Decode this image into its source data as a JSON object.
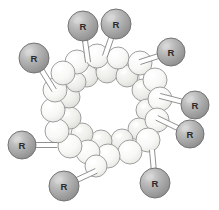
{
  "figure": {
    "width": 219,
    "height": 210,
    "background_color": "#ffffff"
  },
  "style": {
    "ring_sphere_fill": "#f7f7f5",
    "ring_sphere_fill_shaded": "#ededea",
    "ring_sphere_stroke": "#9a9a9a",
    "ring_sphere_stroke_faint": "#bdbdbd",
    "ring_sphere_highlight": "#ffffff",
    "r_sphere_fill": "#b0b0b0",
    "r_sphere_fill_dark": "#8f8f8f",
    "r_sphere_stroke": "#6f6f6f",
    "r_sphere_highlight": "#d8d8d8",
    "bond_fill": "#ffffff",
    "bond_stroke": "#7d7d7d",
    "label_color": "#2b2b2b"
  },
  "cavity": {
    "label": "macrocycle-cavity",
    "center_x": 108,
    "center_y": 104,
    "radius_x": 34,
    "radius_y": 32
  },
  "r_groups": [
    {
      "id": "r-top-left",
      "label": "R",
      "cx": 83,
      "cy": 26,
      "radius": 15,
      "anchor_x": 88,
      "anchor_y": 62
    },
    {
      "id": "r-top-right",
      "label": "R",
      "cx": 116,
      "cy": 24,
      "radius": 15,
      "anchor_x": 105,
      "anchor_y": 56
    },
    {
      "id": "r-upper-right",
      "label": "R",
      "cx": 171,
      "cy": 52,
      "radius": 14,
      "anchor_x": 140,
      "anchor_y": 62
    },
    {
      "id": "r-upper-left",
      "label": "R",
      "cx": 34,
      "cy": 58,
      "radius": 15,
      "anchor_x": 54,
      "anchor_y": 90
    },
    {
      "id": "r-right-upper",
      "label": "R",
      "cx": 195,
      "cy": 105,
      "radius": 14,
      "anchor_x": 160,
      "anchor_y": 96
    },
    {
      "id": "r-right-lower",
      "label": "R",
      "cx": 190,
      "cy": 134,
      "radius": 14,
      "anchor_x": 157,
      "anchor_y": 118
    },
    {
      "id": "r-left-lower",
      "label": "R",
      "cx": 22,
      "cy": 145,
      "radius": 14,
      "anchor_x": 57,
      "anchor_y": 145
    },
    {
      "id": "r-bottom-left",
      "label": "R",
      "cx": 64,
      "cy": 186,
      "radius": 15,
      "anchor_x": 96,
      "anchor_y": 171
    },
    {
      "id": "r-bottom-right",
      "label": "R",
      "cx": 155,
      "cy": 183,
      "radius": 15,
      "anchor_x": 152,
      "anchor_y": 150
    }
  ],
  "ring_spheres": [
    {
      "id": "ring-01",
      "cx": 77,
      "cy": 62,
      "r": 12,
      "shade": "light"
    },
    {
      "id": "ring-02",
      "cx": 97,
      "cy": 56,
      "r": 12,
      "shade": "light"
    },
    {
      "id": "ring-03",
      "cx": 118,
      "cy": 58,
      "r": 11,
      "shade": "light"
    },
    {
      "id": "ring-04",
      "cx": 140,
      "cy": 63,
      "r": 12,
      "shade": "light"
    },
    {
      "id": "ring-05",
      "cx": 155,
      "cy": 80,
      "r": 12,
      "shade": "light"
    },
    {
      "id": "ring-06",
      "cx": 160,
      "cy": 99,
      "r": 12,
      "shade": "light"
    },
    {
      "id": "ring-07",
      "cx": 157,
      "cy": 120,
      "r": 12,
      "shade": "light"
    },
    {
      "id": "ring-08",
      "cx": 148,
      "cy": 140,
      "r": 12,
      "shade": "light"
    },
    {
      "id": "ring-09",
      "cx": 130,
      "cy": 152,
      "r": 12,
      "shade": "light"
    },
    {
      "id": "ring-10",
      "cx": 108,
      "cy": 156,
      "r": 12,
      "shade": "light"
    },
    {
      "id": "ring-11",
      "cx": 88,
      "cy": 152,
      "r": 12,
      "shade": "light"
    },
    {
      "id": "ring-12",
      "cx": 70,
      "cy": 146,
      "r": 12,
      "shade": "light"
    },
    {
      "id": "ring-13",
      "cx": 57,
      "cy": 131,
      "r": 12,
      "shade": "light"
    },
    {
      "id": "ring-14",
      "cx": 53,
      "cy": 110,
      "r": 12,
      "shade": "light"
    },
    {
      "id": "ring-15",
      "cx": 55,
      "cy": 90,
      "r": 12,
      "shade": "light"
    },
    {
      "id": "ring-16",
      "cx": 63,
      "cy": 73,
      "r": 12,
      "shade": "light"
    },
    {
      "id": "ring-17",
      "cx": 87,
      "cy": 76,
      "r": 11,
      "shade": "shaded"
    },
    {
      "id": "ring-18",
      "cx": 107,
      "cy": 72,
      "r": 11,
      "shade": "shaded"
    },
    {
      "id": "ring-19",
      "cx": 127,
      "cy": 76,
      "r": 11,
      "shade": "shaded"
    },
    {
      "id": "ring-20",
      "cx": 143,
      "cy": 90,
      "r": 11,
      "shade": "shaded"
    },
    {
      "id": "ring-21",
      "cx": 147,
      "cy": 110,
      "r": 11,
      "shade": "shaded"
    },
    {
      "id": "ring-22",
      "cx": 139,
      "cy": 129,
      "r": 11,
      "shade": "shaded"
    },
    {
      "id": "ring-23",
      "cx": 122,
      "cy": 140,
      "r": 11,
      "shade": "shaded"
    },
    {
      "id": "ring-24",
      "cx": 101,
      "cy": 141,
      "r": 11,
      "shade": "shaded"
    },
    {
      "id": "ring-25",
      "cx": 82,
      "cy": 134,
      "r": 11,
      "shade": "shaded"
    },
    {
      "id": "ring-26",
      "cx": 70,
      "cy": 118,
      "r": 11,
      "shade": "shaded"
    },
    {
      "id": "ring-27",
      "cx": 69,
      "cy": 97,
      "r": 11,
      "shade": "shaded"
    },
    {
      "id": "ring-28",
      "cx": 76,
      "cy": 82,
      "r": 10,
      "shade": "shaded"
    },
    {
      "id": "ring-29",
      "cx": 96,
      "cy": 166,
      "r": 11,
      "shade": "light"
    },
    {
      "id": "ring-30",
      "cx": 114,
      "cy": 67,
      "r": 10,
      "shade": "faint"
    },
    {
      "id": "ring-31",
      "cx": 133,
      "cy": 67,
      "r": 10,
      "shade": "faint"
    },
    {
      "id": "ring-32",
      "cx": 151,
      "cy": 127,
      "r": 10,
      "shade": "faint"
    },
    {
      "id": "ring-33",
      "cx": 64,
      "cy": 104,
      "r": 10,
      "shade": "faint"
    },
    {
      "id": "ring-34",
      "cx": 93,
      "cy": 69,
      "r": 10,
      "shade": "faint"
    }
  ],
  "ring_bonds": [
    {
      "from": "ring-01",
      "to": "ring-02"
    },
    {
      "from": "ring-02",
      "to": "ring-03"
    },
    {
      "from": "ring-03",
      "to": "ring-04"
    },
    {
      "from": "ring-04",
      "to": "ring-05"
    },
    {
      "from": "ring-05",
      "to": "ring-06"
    },
    {
      "from": "ring-06",
      "to": "ring-07"
    },
    {
      "from": "ring-07",
      "to": "ring-08"
    },
    {
      "from": "ring-08",
      "to": "ring-09"
    },
    {
      "from": "ring-09",
      "to": "ring-10"
    },
    {
      "from": "ring-10",
      "to": "ring-11"
    },
    {
      "from": "ring-11",
      "to": "ring-12"
    },
    {
      "from": "ring-12",
      "to": "ring-13"
    },
    {
      "from": "ring-13",
      "to": "ring-14"
    },
    {
      "from": "ring-14",
      "to": "ring-15"
    },
    {
      "from": "ring-15",
      "to": "ring-16"
    },
    {
      "from": "ring-16",
      "to": "ring-01"
    },
    {
      "from": "ring-17",
      "to": "ring-18"
    },
    {
      "from": "ring-18",
      "to": "ring-19"
    },
    {
      "from": "ring-19",
      "to": "ring-20"
    },
    {
      "from": "ring-20",
      "to": "ring-21"
    },
    {
      "from": "ring-21",
      "to": "ring-22"
    },
    {
      "from": "ring-22",
      "to": "ring-23"
    },
    {
      "from": "ring-23",
      "to": "ring-24"
    },
    {
      "from": "ring-24",
      "to": "ring-25"
    },
    {
      "from": "ring-25",
      "to": "ring-26"
    },
    {
      "from": "ring-26",
      "to": "ring-27"
    },
    {
      "from": "ring-27",
      "to": "ring-28"
    },
    {
      "from": "ring-28",
      "to": "ring-17"
    },
    {
      "from": "ring-01",
      "to": "ring-17"
    },
    {
      "from": "ring-02",
      "to": "ring-18"
    },
    {
      "from": "ring-04",
      "to": "ring-20"
    },
    {
      "from": "ring-06",
      "to": "ring-21"
    },
    {
      "from": "ring-08",
      "to": "ring-22"
    },
    {
      "from": "ring-10",
      "to": "ring-24"
    },
    {
      "from": "ring-12",
      "to": "ring-25"
    },
    {
      "from": "ring-14",
      "to": "ring-27"
    },
    {
      "from": "ring-11",
      "to": "ring-29"
    },
    {
      "from": "ring-29",
      "to": "ring-10"
    }
  ]
}
